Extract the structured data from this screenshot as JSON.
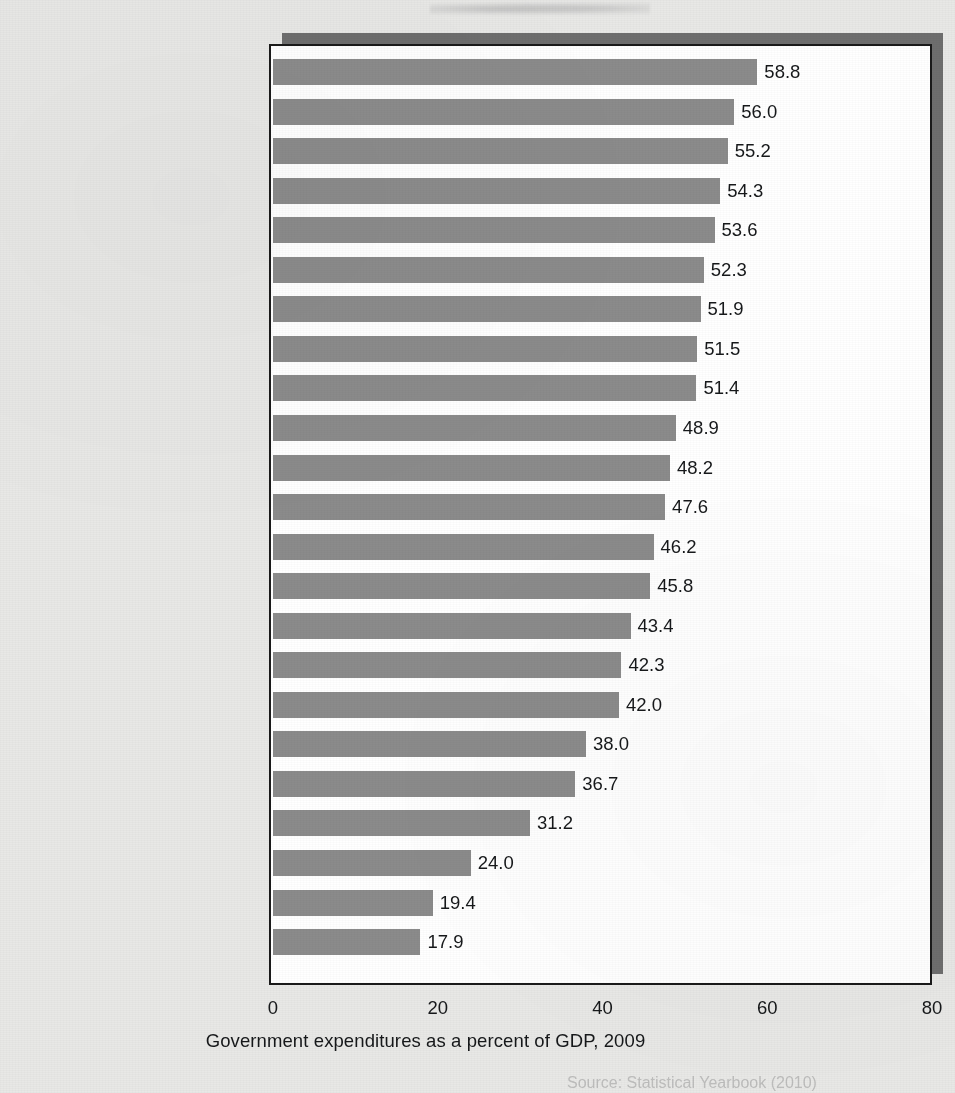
{
  "chart_data": {
    "type": "bar",
    "orientation": "horizontal",
    "title": "",
    "xlabel": "Government expenditures as a percent of GDP, 2009",
    "ylabel": "",
    "xlim": [
      0,
      80
    ],
    "xticks": [
      0,
      20,
      40,
      60,
      80
    ],
    "xtick_labels": [
      "0",
      "20",
      "40",
      "60",
      "80"
    ],
    "grid": false,
    "legend": false,
    "bar_color": "#8b8b8b",
    "value_labels": true,
    "categories": [
      "Denmark",
      "France",
      "Sweden",
      "Belgium",
      "Greece",
      "Austria",
      "Italy",
      "United Kingdom",
      "Netherlands",
      "Ireland",
      "Portugal",
      "Germany",
      "Norway",
      "Spain",
      "Canada",
      "Japan",
      "United States",
      "New Zealand",
      "Australia",
      "South Korea",
      "Thailand",
      "Hong Kong",
      "Singapore"
    ],
    "values": [
      58.8,
      56.0,
      55.2,
      54.3,
      53.6,
      52.3,
      51.9,
      51.5,
      51.4,
      48.9,
      48.2,
      47.6,
      46.2,
      45.8,
      43.4,
      42.3,
      42.0,
      38.0,
      36.7,
      31.2,
      24.0,
      19.4,
      17.9
    ],
    "value_text": [
      "58.8",
      "56.0",
      "55.2",
      "54.3",
      "53.6",
      "52.3",
      "51.9",
      "51.5",
      "51.4",
      "48.9",
      "48.2",
      "47.6",
      "46.2",
      "45.8",
      "43.4",
      "42.3",
      "42.0",
      "38.0",
      "36.7",
      "31.2",
      "24.0",
      "19.4",
      "17.9"
    ]
  },
  "axis": {
    "title": "Government expenditures as a percent of GDP, 2009"
  },
  "source": {
    "text": "Source: Statistical Yearbook (2010)"
  }
}
